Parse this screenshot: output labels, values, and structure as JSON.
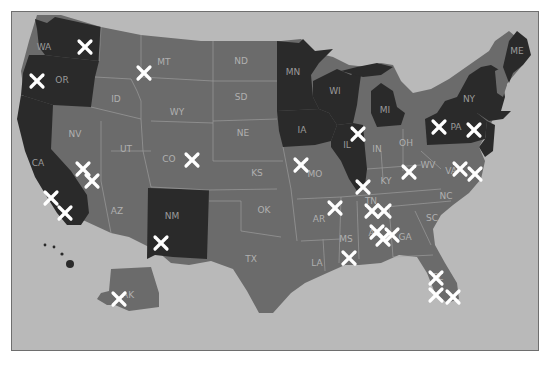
{
  "map": {
    "title": "",
    "colors": {
      "ocean": "#b9b9b9",
      "highlighted_state": "#2a2a2a",
      "other_state": "#6b6b6b",
      "marker": "#ffffff",
      "frame_border": "#6e6e6e"
    },
    "highlighted_states": [
      "WA",
      "OR",
      "CA",
      "NM",
      "MN",
      "IA",
      "WI",
      "IL",
      "MI",
      "NY",
      "PA",
      "ME",
      "HI"
    ],
    "labels": [
      {
        "code": "WA",
        "x": 43,
        "y": 46,
        "dark": true
      },
      {
        "code": "OR",
        "x": 61,
        "y": 79,
        "dark": true
      },
      {
        "code": "CA",
        "x": 37,
        "y": 162,
        "dark": true
      },
      {
        "code": "MT",
        "x": 163,
        "y": 61,
        "dark": false
      },
      {
        "code": "ID",
        "x": 115,
        "y": 98,
        "dark": false
      },
      {
        "code": "WY",
        "x": 176,
        "y": 111,
        "dark": false
      },
      {
        "code": "NV",
        "x": 74,
        "y": 133,
        "dark": false
      },
      {
        "code": "UT",
        "x": 125,
        "y": 148,
        "dark": false
      },
      {
        "code": "CO",
        "x": 168,
        "y": 158,
        "dark": false
      },
      {
        "code": "AZ",
        "x": 116,
        "y": 210,
        "dark": false
      },
      {
        "code": "NM",
        "x": 171,
        "y": 215,
        "dark": true
      },
      {
        "code": "ND",
        "x": 240,
        "y": 60,
        "dark": false
      },
      {
        "code": "SD",
        "x": 240,
        "y": 96,
        "dark": false
      },
      {
        "code": "NE",
        "x": 242,
        "y": 132,
        "dark": false
      },
      {
        "code": "KS",
        "x": 256,
        "y": 172,
        "dark": false
      },
      {
        "code": "OK",
        "x": 263,
        "y": 209,
        "dark": false
      },
      {
        "code": "TX",
        "x": 250,
        "y": 258,
        "dark": false
      },
      {
        "code": "MN",
        "x": 292,
        "y": 71,
        "dark": true
      },
      {
        "code": "IA",
        "x": 301,
        "y": 129,
        "dark": true
      },
      {
        "code": "MO",
        "x": 314,
        "y": 173,
        "dark": false
      },
      {
        "code": "AR",
        "x": 318,
        "y": 218,
        "dark": false
      },
      {
        "code": "LA",
        "x": 316,
        "y": 262,
        "dark": false
      },
      {
        "code": "WI",
        "x": 334,
        "y": 90,
        "dark": true
      },
      {
        "code": "IL",
        "x": 346,
        "y": 144,
        "dark": true
      },
      {
        "code": "MS",
        "x": 345,
        "y": 238,
        "dark": false
      },
      {
        "code": "MI",
        "x": 384,
        "y": 109,
        "dark": true
      },
      {
        "code": "IN",
        "x": 376,
        "y": 148,
        "dark": false
      },
      {
        "code": "OH",
        "x": 405,
        "y": 142,
        "dark": false
      },
      {
        "code": "KY",
        "x": 385,
        "y": 180,
        "dark": false
      },
      {
        "code": "TN",
        "x": 370,
        "y": 200,
        "dark": false
      },
      {
        "code": "AL",
        "x": 373,
        "y": 232,
        "dark": false
      },
      {
        "code": "GA",
        "x": 404,
        "y": 236,
        "dark": false
      },
      {
        "code": "SC",
        "x": 431,
        "y": 217,
        "dark": false
      },
      {
        "code": "NC",
        "x": 445,
        "y": 195,
        "dark": false
      },
      {
        "code": "VA",
        "x": 450,
        "y": 170,
        "dark": false
      },
      {
        "code": "WV",
        "x": 427,
        "y": 164,
        "dark": false
      },
      {
        "code": "FL",
        "x": 437,
        "y": 276,
        "dark": false
      },
      {
        "code": "PA",
        "x": 455,
        "y": 126,
        "dark": true
      },
      {
        "code": "NY",
        "x": 468,
        "y": 98,
        "dark": true
      },
      {
        "code": "ME",
        "x": 516,
        "y": 50,
        "dark": true
      },
      {
        "code": "AK",
        "x": 127,
        "y": 294,
        "dark": false
      }
    ],
    "markers": [
      {
        "x": 84,
        "y": 46
      },
      {
        "x": 36,
        "y": 80
      },
      {
        "x": 143,
        "y": 72
      },
      {
        "x": 82,
        "y": 168
      },
      {
        "x": 91,
        "y": 180
      },
      {
        "x": 50,
        "y": 197
      },
      {
        "x": 64,
        "y": 212
      },
      {
        "x": 191,
        "y": 159
      },
      {
        "x": 160,
        "y": 242
      },
      {
        "x": 118,
        "y": 298
      },
      {
        "x": 300,
        "y": 164
      },
      {
        "x": 357,
        "y": 133
      },
      {
        "x": 362,
        "y": 186
      },
      {
        "x": 334,
        "y": 207
      },
      {
        "x": 371,
        "y": 210
      },
      {
        "x": 383,
        "y": 210
      },
      {
        "x": 376,
        "y": 231
      },
      {
        "x": 382,
        "y": 238
      },
      {
        "x": 391,
        "y": 234
      },
      {
        "x": 348,
        "y": 257
      },
      {
        "x": 408,
        "y": 171
      },
      {
        "x": 438,
        "y": 126
      },
      {
        "x": 473,
        "y": 129
      },
      {
        "x": 459,
        "y": 168
      },
      {
        "x": 474,
        "y": 173
      },
      {
        "x": 435,
        "y": 277
      },
      {
        "x": 435,
        "y": 294
      },
      {
        "x": 452,
        "y": 296
      }
    ]
  }
}
